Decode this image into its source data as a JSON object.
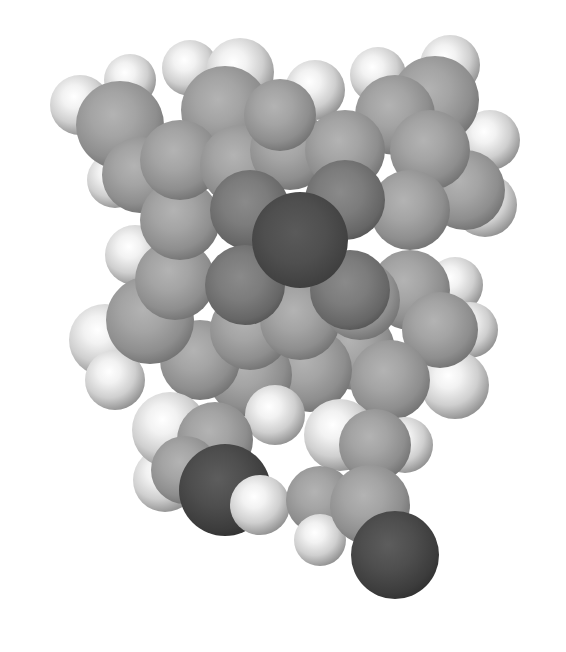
{
  "image": {
    "description": "Greyscale space-filling (CPK) 3D molecular model of a porphyrin-like macrocycle with a central metal atom and two carbonyl-bearing side chains",
    "background_color": "#ffffff",
    "element_colors": {
      "H": "#e6e6e6",
      "C": "#9a9a9a",
      "N": "#707070",
      "O": "#3f3f3f",
      "M": "#474747"
    }
  },
  "atoms": [
    {
      "el": "H",
      "x": 80,
      "y": 105,
      "r": 30
    },
    {
      "el": "H",
      "x": 130,
      "y": 80,
      "r": 26
    },
    {
      "el": "H",
      "x": 190,
      "y": 68,
      "r": 28
    },
    {
      "el": "H",
      "x": 240,
      "y": 72,
      "r": 34
    },
    {
      "el": "H",
      "x": 315,
      "y": 90,
      "r": 30
    },
    {
      "el": "H",
      "x": 378,
      "y": 75,
      "r": 28
    },
    {
      "el": "H",
      "x": 450,
      "y": 65,
      "r": 30
    },
    {
      "el": "H",
      "x": 490,
      "y": 140,
      "r": 30
    },
    {
      "el": "H",
      "x": 485,
      "y": 205,
      "r": 32
    },
    {
      "el": "H",
      "x": 455,
      "y": 285,
      "r": 28
    },
    {
      "el": "H",
      "x": 470,
      "y": 330,
      "r": 28
    },
    {
      "el": "H",
      "x": 455,
      "y": 385,
      "r": 34
    },
    {
      "el": "H",
      "x": 135,
      "y": 255,
      "r": 30
    },
    {
      "el": "H",
      "x": 115,
      "y": 180,
      "r": 28
    },
    {
      "el": "H",
      "x": 105,
      "y": 340,
      "r": 36
    },
    {
      "el": "H",
      "x": 115,
      "y": 380,
      "r": 30
    },
    {
      "el": "C",
      "x": 120,
      "y": 125,
      "r": 44
    },
    {
      "el": "C",
      "x": 140,
      "y": 175,
      "r": 38
    },
    {
      "el": "C",
      "x": 225,
      "y": 110,
      "r": 44
    },
    {
      "el": "C",
      "x": 435,
      "y": 100,
      "r": 44
    },
    {
      "el": "C",
      "x": 395,
      "y": 115,
      "r": 40
    },
    {
      "el": "C",
      "x": 465,
      "y": 190,
      "r": 40
    },
    {
      "el": "C",
      "x": 430,
      "y": 150,
      "r": 40
    },
    {
      "el": "C",
      "x": 410,
      "y": 210,
      "r": 40
    },
    {
      "el": "C",
      "x": 410,
      "y": 290,
      "r": 40
    },
    {
      "el": "C",
      "x": 440,
      "y": 330,
      "r": 38
    },
    {
      "el": "C",
      "x": 355,
      "y": 350,
      "r": 40
    },
    {
      "el": "C",
      "x": 390,
      "y": 380,
      "r": 40
    },
    {
      "el": "C",
      "x": 310,
      "y": 370,
      "r": 42
    },
    {
      "el": "C",
      "x": 250,
      "y": 375,
      "r": 42
    },
    {
      "el": "C",
      "x": 200,
      "y": 360,
      "r": 40
    },
    {
      "el": "C",
      "x": 150,
      "y": 320,
      "r": 44
    },
    {
      "el": "C",
      "x": 175,
      "y": 280,
      "r": 40
    },
    {
      "el": "C",
      "x": 180,
      "y": 220,
      "r": 40
    },
    {
      "el": "C",
      "x": 180,
      "y": 160,
      "r": 40
    },
    {
      "el": "C",
      "x": 240,
      "y": 165,
      "r": 40
    },
    {
      "el": "C",
      "x": 290,
      "y": 150,
      "r": 40
    },
    {
      "el": "C",
      "x": 345,
      "y": 150,
      "r": 40
    },
    {
      "el": "C",
      "x": 280,
      "y": 115,
      "r": 36
    },
    {
      "el": "C",
      "x": 250,
      "y": 330,
      "r": 40
    },
    {
      "el": "C",
      "x": 300,
      "y": 320,
      "r": 40
    },
    {
      "el": "C",
      "x": 360,
      "y": 300,
      "r": 40
    },
    {
      "el": "N",
      "x": 250,
      "y": 210,
      "r": 40
    },
    {
      "el": "N",
      "x": 345,
      "y": 200,
      "r": 40
    },
    {
      "el": "N",
      "x": 350,
      "y": 290,
      "r": 40
    },
    {
      "el": "N",
      "x": 245,
      "y": 285,
      "r": 40
    },
    {
      "el": "M",
      "x": 300,
      "y": 240,
      "r": 48
    },
    {
      "el": "H",
      "x": 275,
      "y": 415,
      "r": 30
    },
    {
      "el": "H",
      "x": 165,
      "y": 480,
      "r": 32
    },
    {
      "el": "H",
      "x": 170,
      "y": 430,
      "r": 38
    },
    {
      "el": "C",
      "x": 215,
      "y": 440,
      "r": 38
    },
    {
      "el": "C",
      "x": 185,
      "y": 470,
      "r": 34
    },
    {
      "el": "O",
      "x": 225,
      "y": 490,
      "r": 46
    },
    {
      "el": "H",
      "x": 260,
      "y": 505,
      "r": 30
    },
    {
      "el": "H",
      "x": 340,
      "y": 435,
      "r": 36
    },
    {
      "el": "H",
      "x": 405,
      "y": 445,
      "r": 28
    },
    {
      "el": "C",
      "x": 375,
      "y": 445,
      "r": 36
    },
    {
      "el": "C",
      "x": 320,
      "y": 500,
      "r": 34
    },
    {
      "el": "H",
      "x": 320,
      "y": 540,
      "r": 26
    },
    {
      "el": "C",
      "x": 370,
      "y": 505,
      "r": 40
    },
    {
      "el": "O",
      "x": 395,
      "y": 555,
      "r": 44
    }
  ]
}
